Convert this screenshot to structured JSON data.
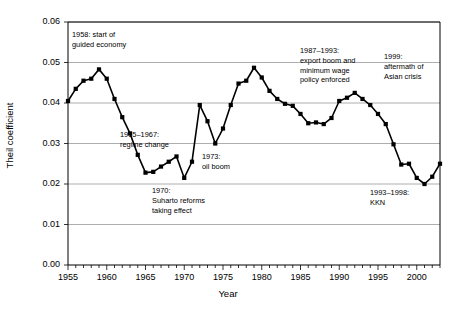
{
  "chart_data": {
    "type": "line",
    "title": "",
    "xlabel": "Year",
    "ylabel": "Theil coefficient",
    "xlim": [
      1955,
      2003
    ],
    "ylim": [
      0.0,
      0.06
    ],
    "grid": true,
    "legend": "none",
    "marker": "square",
    "line_color": "#000000",
    "grid_color": "#999999",
    "ytick_labels": [
      "0.00",
      "0.01",
      "0.02",
      "0.03",
      "0.04",
      "0.05",
      "0.06"
    ],
    "ytick_values": [
      0.0,
      0.01,
      0.02,
      0.03,
      0.04,
      0.05,
      0.06
    ],
    "xtick_labels": [
      "1955",
      "1960",
      "1965",
      "1970",
      "1975",
      "1980",
      "1985",
      "1990",
      "1995",
      "2000"
    ],
    "xtick_values": [
      1955,
      1960,
      1965,
      1970,
      1975,
      1980,
      1985,
      1990,
      1995,
      2000
    ],
    "x": [
      1955,
      1956,
      1957,
      1958,
      1959,
      1960,
      1961,
      1962,
      1963,
      1964,
      1965,
      1966,
      1967,
      1968,
      1969,
      1970,
      1971,
      1972,
      1973,
      1974,
      1975,
      1976,
      1977,
      1978,
      1979,
      1980,
      1981,
      1982,
      1983,
      1984,
      1985,
      1986,
      1987,
      1988,
      1989,
      1990,
      1991,
      1992,
      1993,
      1994,
      1995,
      1996,
      1997,
      1998,
      1999,
      2000,
      2001,
      2002,
      2003
    ],
    "values": [
      0.0405,
      0.0435,
      0.0455,
      0.046,
      0.0483,
      0.046,
      0.041,
      0.0365,
      0.0325,
      0.0272,
      0.0228,
      0.023,
      0.0243,
      0.0255,
      0.0268,
      0.0215,
      0.0255,
      0.0395,
      0.0355,
      0.03,
      0.0337,
      0.0395,
      0.0448,
      0.0455,
      0.0487,
      0.0463,
      0.043,
      0.041,
      0.0398,
      0.0393,
      0.0373,
      0.035,
      0.0352,
      0.0348,
      0.0363,
      0.0405,
      0.0413,
      0.0425,
      0.041,
      0.0395,
      0.0373,
      0.0348,
      0.0298,
      0.0248,
      0.025,
      0.0215,
      0.02,
      0.0218,
      0.025
    ]
  },
  "annotations": [
    {
      "key": "guided_economy",
      "text": "1958: start of\nguided economy"
    },
    {
      "key": "regime_change",
      "text": "1965–1967:\nregime change"
    },
    {
      "key": "suharto_reforms",
      "text": "1970:\nSuharto reforms\ntaking effect"
    },
    {
      "key": "oil_boom",
      "text": "1973:\noil boom"
    },
    {
      "key": "export_boom",
      "text": "1987–1993:\nexport boom and\nminimum wage\npolicy enforced"
    },
    {
      "key": "asian_crisis",
      "text": "1999:\naftermath of\nAsian crisis"
    },
    {
      "key": "kkn",
      "text": "1993–1998:\nKKN"
    }
  ]
}
